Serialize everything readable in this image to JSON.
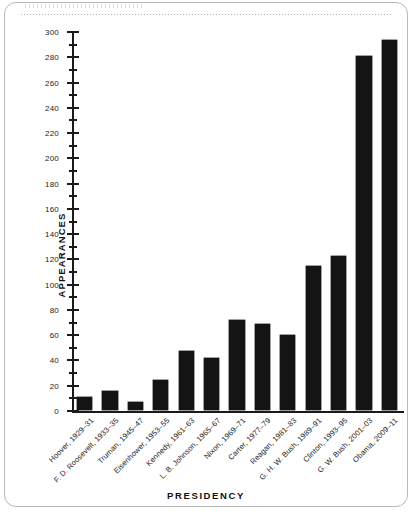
{
  "figure": {
    "ylabel": "APPEARANCES",
    "xlabel": "PRESIDENCY",
    "bar_color": "#141414",
    "axis_color": "#1a1a1a",
    "frame_color": "#b8b8b8"
  },
  "chart_data": {
    "type": "bar",
    "title": "",
    "xlabel": "PRESIDENCY",
    "ylabel": "APPEARANCES",
    "ylim": [
      0,
      300
    ],
    "ytick_step": 20,
    "yminor_step": 10,
    "grid": false,
    "legend": null,
    "yticks": [
      0,
      20,
      40,
      60,
      80,
      100,
      120,
      140,
      160,
      180,
      200,
      220,
      240,
      260,
      280,
      300
    ],
    "ytick_labels": [
      "0",
      "20",
      "40",
      "60",
      "80",
      "100",
      "120",
      "140",
      "160",
      "180",
      "200",
      "220",
      "240",
      "260",
      "280",
      "300"
    ],
    "categories": [
      "Hoover, 1929–31",
      "F. D. Roosevelt, 1933–35",
      "Truman, 1945–47",
      "Eisenhower, 1953–55",
      "Kennedy, 1961–63",
      "L. B. Johnson, 1965–67",
      "Nixon, 1969–71",
      "Carter, 1977–79",
      "Reagan, 1981–83",
      "G. H. W. Bush, 1989–91",
      "Clinton, 1993–95",
      "G. W. Bush, 2001–03",
      "Obama, 2009–11"
    ],
    "values": [
      10,
      15,
      6,
      24,
      47,
      41,
      71,
      68,
      59,
      114,
      122,
      280,
      293
    ]
  }
}
